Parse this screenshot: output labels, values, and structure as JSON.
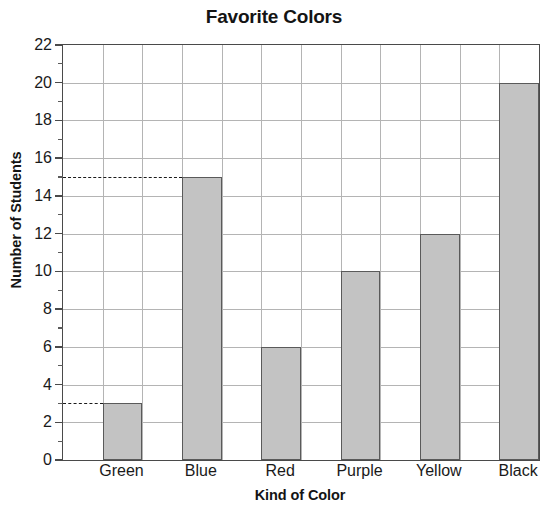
{
  "chart_data": {
    "type": "bar",
    "title": "Favorite Colors",
    "xlabel": "Kind of Color",
    "ylabel": "Number of Students",
    "categories": [
      "Green",
      "Blue",
      "Red",
      "Purple",
      "Yellow",
      "Black"
    ],
    "values": [
      3,
      15,
      6,
      10,
      12,
      20
    ],
    "ylim": [
      0,
      22
    ],
    "ytick_step": 2,
    "ytick_labels": [
      "0",
      "2",
      "4",
      "6",
      "8",
      "10",
      "12",
      "14",
      "16",
      "18",
      "20",
      "22"
    ],
    "yminor_step": 1,
    "grid": true,
    "legend": null,
    "annotations": [
      {
        "type": "dashed-guide",
        "y": 15,
        "from": "y-axis",
        "to": "Blue"
      },
      {
        "type": "dashed-guide",
        "y": 3,
        "from": "y-axis",
        "to": "Green"
      }
    ],
    "colors": {
      "bar_fill": "#c3c3c3",
      "bar_border": "#5a5a5a",
      "gridline": "#b4b4b4",
      "axis": "#4a4a4a",
      "text": "#1a1a1a",
      "background": "#ffffff"
    }
  }
}
